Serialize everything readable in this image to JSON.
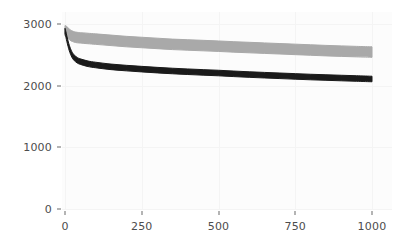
{
  "chart_data": {
    "type": "line",
    "title": "",
    "subtitle": "",
    "xlabel": "",
    "ylabel": "",
    "xlim": [
      0,
      1000
    ],
    "ylim": [
      0,
      3000
    ],
    "xticks": [
      0,
      250,
      500,
      750,
      1000
    ],
    "yticks": [
      0,
      1000,
      2000,
      3000
    ],
    "xtick_labels": [
      "0",
      "250",
      "500",
      "750",
      "1000"
    ],
    "ytick_labels": [
      "0",
      "1000",
      "2000",
      "3000"
    ],
    "grid": true,
    "legend": "none",
    "series": [
      {
        "name": "upper-gray-curve",
        "color": "#a9a9a9",
        "style": "band",
        "linewidth": 11,
        "x": [
          0,
          5,
          10,
          15,
          20,
          25,
          30,
          40,
          50,
          75,
          100,
          150,
          200,
          250,
          300,
          350,
          400,
          450,
          500,
          550,
          600,
          650,
          700,
          750,
          800,
          850,
          900,
          950,
          1000
        ],
        "values": [
          2890,
          2880,
          2850,
          2830,
          2810,
          2800,
          2790,
          2780,
          2775,
          2765,
          2755,
          2735,
          2715,
          2700,
          2685,
          2670,
          2660,
          2650,
          2640,
          2628,
          2618,
          2608,
          2598,
          2588,
          2578,
          2568,
          2560,
          2552,
          2545
        ],
        "band_halfwidth": 85
      },
      {
        "name": "lower-black-curve",
        "color": "#1a1a1a",
        "style": "band",
        "linewidth": 7,
        "x": [
          0,
          3,
          6,
          10,
          14,
          18,
          22,
          26,
          30,
          40,
          50,
          75,
          100,
          150,
          200,
          250,
          300,
          350,
          400,
          450,
          500,
          550,
          600,
          650,
          700,
          750,
          800,
          850,
          900,
          950,
          1000
        ],
        "values": [
          2885,
          2830,
          2760,
          2680,
          2610,
          2555,
          2510,
          2478,
          2452,
          2412,
          2390,
          2355,
          2335,
          2305,
          2285,
          2268,
          2252,
          2238,
          2226,
          2215,
          2205,
          2192,
          2180,
          2170,
          2160,
          2150,
          2140,
          2132,
          2124,
          2116,
          2108
        ],
        "band_halfwidth": 45
      }
    ]
  },
  "axes": {
    "x_axis_name": "x-axis",
    "y_axis_name": "y-axis"
  }
}
